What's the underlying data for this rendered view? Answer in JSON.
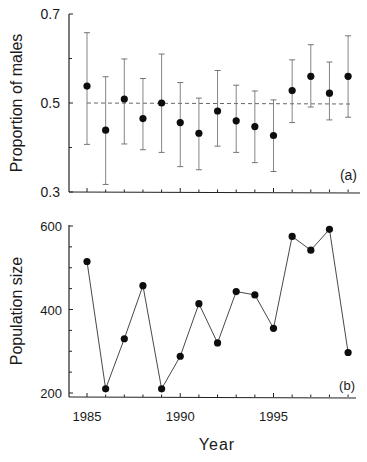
{
  "figure": {
    "xlabel": "Year",
    "panel_a_label": "(a)",
    "panel_b_label": "(b)"
  },
  "chart_data": [
    {
      "type": "scatter",
      "panel": "(a)",
      "title": "",
      "xlabel": "Year",
      "ylabel": "Proportion of males",
      "ylim": [
        0.3,
        0.7
      ],
      "yticks": [
        "0.3",
        "0.5",
        "0.7"
      ],
      "yminor_ticks": [
        0.4,
        0.6
      ],
      "x": [
        1985,
        1986,
        1987,
        1988,
        1989,
        1990,
        1991,
        1992,
        1993,
        1994,
        1995,
        1996,
        1997,
        1998,
        1999
      ],
      "values": [
        0.538,
        0.439,
        0.509,
        0.465,
        0.5,
        0.456,
        0.432,
        0.482,
        0.46,
        0.447,
        0.427,
        0.528,
        0.56,
        0.522,
        0.56
      ],
      "error_upper": [
        0.658,
        0.559,
        0.599,
        0.555,
        0.61,
        0.546,
        0.511,
        0.573,
        0.54,
        0.527,
        0.507,
        0.597,
        0.631,
        0.592,
        0.651
      ],
      "error_lower": [
        0.407,
        0.317,
        0.408,
        0.395,
        0.389,
        0.357,
        0.35,
        0.403,
        0.389,
        0.366,
        0.346,
        0.456,
        0.491,
        0.462,
        0.468
      ],
      "reference_line": {
        "y": 0.5,
        "style": "dashed"
      },
      "grid": false
    },
    {
      "type": "line",
      "panel": "(b)",
      "title": "",
      "xlabel": "Year",
      "ylabel": "Population size",
      "ylim": [
        200,
        600
      ],
      "yticks": [
        "200",
        "400",
        "600"
      ],
      "yminor_ticks": [
        250,
        300,
        350,
        450,
        500,
        550
      ],
      "xticks": [
        "1985",
        "1990",
        "1995"
      ],
      "x": [
        1985,
        1986,
        1987,
        1988,
        1989,
        1990,
        1991,
        1992,
        1993,
        1994,
        1995,
        1996,
        1997,
        1998,
        1999
      ],
      "values": [
        515,
        210,
        330,
        457,
        210,
        288,
        414,
        320,
        443,
        435,
        355,
        575,
        542,
        592,
        297
      ],
      "markers": true,
      "grid": false
    }
  ]
}
